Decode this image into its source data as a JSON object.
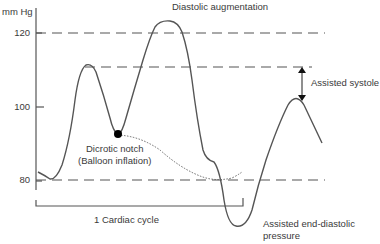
{
  "diagram": {
    "title": "Diastolic augmentation",
    "y_axis": {
      "unit": "mm Hg",
      "ticks": [
        "120",
        "100",
        "80"
      ]
    },
    "labels": {
      "diastolic_augmentation": "Diastolic augmentation",
      "assisted_systole": "Assisted systole",
      "dicrotic_notch_line1": "Dicrotic notch",
      "dicrotic_notch_line2": "(Balloon inflation)",
      "cardiac_cycle": "1 Cardiac cycle",
      "assisted_edp_line1": "Assisted end-diastolic",
      "assisted_edp_line2": "pressure"
    },
    "colors": {
      "line": "#555555",
      "text": "#3a3a3a",
      "marker": "#000000"
    }
  }
}
